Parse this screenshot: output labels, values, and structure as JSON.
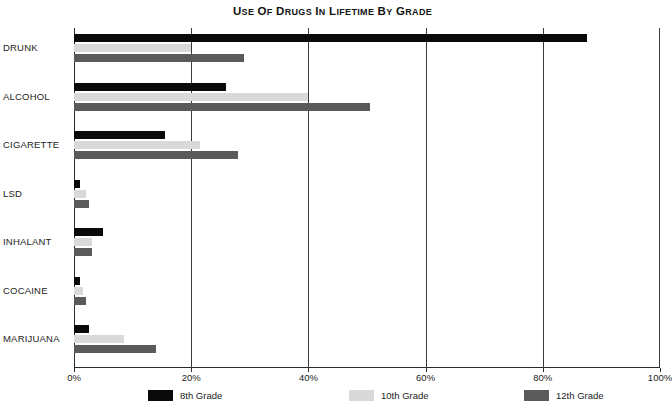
{
  "chart_data": {
    "type": "bar",
    "orientation": "horizontal",
    "title": "Use Of Drugs In Lifetime By Grade",
    "xlabel": "",
    "ylabel": "",
    "xlim": [
      0,
      100
    ],
    "xticks": [
      "0%",
      "20%",
      "40%",
      "60%",
      "80%",
      "100%"
    ],
    "xtick_values": [
      0,
      20,
      40,
      60,
      80,
      100
    ],
    "grid": true,
    "grid_axis": "x",
    "legend_position": "bottom",
    "categories": [
      "DRUNK",
      "ALCOHOL",
      "CIGARETTE",
      "LSD",
      "INHALANT",
      "COCAINE",
      "MARIJUANA"
    ],
    "series": [
      {
        "name": "8th Grade",
        "color": "#0a0a0a",
        "values": [
          87.5,
          26.0,
          15.5,
          1.0,
          5.0,
          1.0,
          2.5
        ]
      },
      {
        "name": "10th Grade",
        "color": "#d9d9d9",
        "values": [
          20.0,
          40.0,
          21.5,
          2.0,
          3.0,
          1.5,
          8.5
        ]
      },
      {
        "name": "12th Grade",
        "color": "#5a5a5a",
        "values": [
          29.0,
          50.5,
          28.0,
          2.5,
          3.0,
          2.0,
          14.0
        ]
      }
    ]
  },
  "colors": {
    "background": "#ffffff",
    "axis": "#2b2b2b",
    "grid": "#3a3a3a",
    "text": "#1d1d1d",
    "series_8th": "#0a0a0a",
    "series_10th": "#d9d9d9",
    "series_12th": "#5a5a5a"
  }
}
